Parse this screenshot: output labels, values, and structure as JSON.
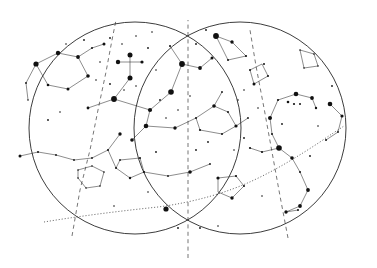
{
  "chart_data": {
    "type": "scatter",
    "xlabel": "",
    "ylabel": "",
    "grid": false,
    "legend": "none",
    "projection": "two overlapping circular horizon discs",
    "cardinals": [
      {
        "label": "SOUTH",
        "x": 188,
        "y": 16
      },
      {
        "label": "W",
        "x": 18,
        "y": 131
      },
      {
        "label": "E",
        "x": 360,
        "y": 131
      }
    ],
    "hour_labels": [
      {
        "label": "4",
        "x": 68,
        "y": 248
      },
      {
        "label": "5",
        "x": 188,
        "y": 256
      },
      {
        "label": "6",
        "x": 288,
        "y": 248
      }
    ],
    "constellations": [
      {
        "name": "VELA",
        "x": 63,
        "y": 71,
        "size": "big"
      },
      {
        "name": "CRUX",
        "x": 140,
        "y": 57,
        "size": "big"
      },
      {
        "name": "CIRCINUS",
        "x": 190,
        "y": 79,
        "size": "big"
      },
      {
        "name": "TRIANG",
        "x": 241,
        "y": 50,
        "size": "small"
      },
      {
        "name": "AUSTR",
        "x": 242,
        "y": 56,
        "size": "small"
      },
      {
        "name": "ARA",
        "x": 249,
        "y": 75,
        "size": "small"
      },
      {
        "name": "TELESCOPIUM",
        "x": 290,
        "y": 62,
        "size": "small"
      },
      {
        "name": "CENTAURUS",
        "x": 135,
        "y": 114,
        "size": "big"
      },
      {
        "name": "LUPUS",
        "x": 222,
        "y": 98,
        "size": "big"
      },
      {
        "name": "SCORPIUS",
        "x": 292,
        "y": 112,
        "size": "big"
      },
      {
        "name": "HYDRA",
        "x": 54,
        "y": 145,
        "size": "small"
      },
      {
        "name": "CRATER",
        "x": 88,
        "y": 180,
        "size": "small"
      },
      {
        "name": "CORVUS",
        "x": 137,
        "y": 175,
        "size": "big"
      },
      {
        "name": "LIBRA",
        "x": 228,
        "y": 172,
        "size": "big"
      },
      {
        "name": "OPHIUCHUS",
        "x": 305,
        "y": 186,
        "size": "small"
      },
      {
        "name": "VIRGO",
        "x": 163,
        "y": 223,
        "size": "small"
      }
    ],
    "named_stars": [
      {
        "name": "Spica",
        "x": 155,
        "y": 206,
        "star_x": 166,
        "star_y": 209,
        "mag_r": 2.6
      },
      {
        "name": "Antares",
        "x": 285,
        "y": 146,
        "star_x": 279,
        "star_y": 148,
        "mag_r": 2.8
      }
    ],
    "ecliptic_labels": [
      {
        "value": "180",
        "x": 64,
        "y": 221
      },
      {
        "value": "190",
        "x": 104,
        "y": 216
      },
      {
        "value": "200",
        "x": 146,
        "y": 212
      },
      {
        "value": "210",
        "x": 183,
        "y": 203
      },
      {
        "value": "220",
        "x": 210,
        "y": 192
      },
      {
        "value": "230",
        "x": 242,
        "y": 188
      },
      {
        "value": "240",
        "x": 265,
        "y": 175
      },
      {
        "value": "250",
        "x": 290,
        "y": 163
      },
      {
        "value": "260",
        "x": 312,
        "y": 146
      },
      {
        "value": "270",
        "x": 333,
        "y": 135
      }
    ],
    "ecliptic_path": "M 44 222 C 80 216 120 211 158 207 C 196 202 228 192 252 181 C 278 169 300 155 320 142 C 330 135 338 130 344 126",
    "boundary_circles": [
      {
        "cx": 135,
        "cy": 128,
        "r": 106
      },
      {
        "cx": 240,
        "cy": 128,
        "r": 106
      }
    ],
    "meridians": [
      {
        "path": "M 72 236 L 80 190 L 90 150 L 98 110 L 106 72 L 112 40 L 116 20"
      },
      {
        "path": "M 188 258 L 188 200 L 188 150 L 188 100 L 188 55 L 188 20"
      },
      {
        "path": "M 288 238 L 280 196 L 272 152 L 264 108 L 256 66 L 250 30"
      }
    ],
    "constellation_lines": [
      "M 36 64 L 58 53 L 78 57 L 88 76 L 68 89 L 48 85 Z",
      "M 78 57 L 92 48 L 104 44",
      "M 36 64 L 26 83 L 28 100",
      "M 130 55 L 130 78",
      "M 118 62 L 142 62",
      "M 114 99 L 130 78",
      "M 114 99 L 88 108",
      "M 114 99 L 150 110",
      "M 150 110 L 171 92",
      "M 150 110 L 146 126",
      "M 146 126 L 175 128",
      "M 146 126 L 132 140",
      "M 171 92 L 182 64",
      "M 182 64 L 170 46",
      "M 182 64 L 200 68",
      "M 200 68 L 212 58",
      "M 175 128 L 196 118",
      "M 196 118 L 214 106",
      "M 214 106 L 228 112",
      "M 228 112 L 236 126",
      "M 236 126 L 222 134",
      "M 222 134 L 200 130",
      "M 200 130 L 196 118",
      "M 214 106 L 222 92",
      "M 236 126 L 248 118",
      "M 216 36 L 232 42",
      "M 232 42 L 246 56",
      "M 246 56 L 228 60",
      "M 228 60 L 216 36",
      "M 250 70 L 262 64",
      "M 262 64 L 268 76",
      "M 268 76 L 254 84",
      "M 254 84 L 250 70",
      "M 300 50 L 314 54",
      "M 314 54 L 318 66",
      "M 318 66 L 304 68",
      "M 304 68 L 300 50",
      "M 270 118 L 278 100",
      "M 278 100 L 296 94",
      "M 296 94 L 312 98",
      "M 312 98 L 316 108",
      "M 270 118 L 272 134",
      "M 272 134 L 279 148",
      "M 279 148 L 292 158",
      "M 292 158 L 300 172",
      "M 300 172 L 308 190",
      "M 308 190 L 300 206",
      "M 300 206 L 286 212",
      "M 279 148 L 262 152",
      "M 262 152 L 250 148",
      "M 330 104 L 342 116",
      "M 342 116 L 338 132",
      "M 338 132 L 326 140",
      "M 20 156 L 38 152 L 56 155 L 74 160 L 92 158 L 108 150 L 120 134",
      "M 108 150 L 116 168",
      "M 116 168 L 130 178",
      "M 130 178 L 144 172",
      "M 144 172 L 140 158",
      "M 140 158 L 120 160",
      "M 120 160 L 116 168",
      "M 78 170 L 92 166 L 104 172 L 100 186 L 86 188 L 78 178 Z",
      "M 144 172 L 168 176 L 190 172 L 210 164",
      "M 218 178 L 236 176 L 244 186 L 232 198 L 218 192 Z",
      "M 286 212 L 298 210"
    ],
    "bright_stars": [
      {
        "x": 36,
        "y": 64,
        "r": 2.6
      },
      {
        "x": 58,
        "y": 53,
        "r": 2.2
      },
      {
        "x": 78,
        "y": 57,
        "r": 1.9
      },
      {
        "x": 88,
        "y": 76,
        "r": 1.8
      },
      {
        "x": 68,
        "y": 89,
        "r": 1.5
      },
      {
        "x": 48,
        "y": 85,
        "r": 1.3
      },
      {
        "x": 130,
        "y": 55,
        "r": 2.5
      },
      {
        "x": 130,
        "y": 78,
        "r": 2.5
      },
      {
        "x": 118,
        "y": 62,
        "r": 2.2
      },
      {
        "x": 142,
        "y": 62,
        "r": 1.6
      },
      {
        "x": 114,
        "y": 99,
        "r": 2.9
      },
      {
        "x": 150,
        "y": 110,
        "r": 2.1
      },
      {
        "x": 171,
        "y": 92,
        "r": 2.8
      },
      {
        "x": 182,
        "y": 64,
        "r": 2.9
      },
      {
        "x": 146,
        "y": 126,
        "r": 2.3
      },
      {
        "x": 175,
        "y": 128,
        "r": 1.7
      },
      {
        "x": 216,
        "y": 36,
        "r": 2.9
      },
      {
        "x": 232,
        "y": 42,
        "r": 1.7
      },
      {
        "x": 200,
        "y": 68,
        "r": 1.9
      },
      {
        "x": 279,
        "y": 148,
        "r": 2.8
      },
      {
        "x": 166,
        "y": 209,
        "r": 2.6
      },
      {
        "x": 296,
        "y": 94,
        "r": 2.3
      },
      {
        "x": 312,
        "y": 98,
        "r": 1.9
      },
      {
        "x": 270,
        "y": 118,
        "r": 2.0
      },
      {
        "x": 292,
        "y": 158,
        "r": 1.8
      },
      {
        "x": 308,
        "y": 190,
        "r": 1.9
      },
      {
        "x": 330,
        "y": 104,
        "r": 2.3
      },
      {
        "x": 342,
        "y": 116,
        "r": 1.6
      },
      {
        "x": 214,
        "y": 106,
        "r": 1.8
      },
      {
        "x": 236,
        "y": 126,
        "r": 1.6
      },
      {
        "x": 132,
        "y": 140,
        "r": 1.8
      },
      {
        "x": 190,
        "y": 172,
        "r": 1.8
      },
      {
        "x": 300,
        "y": 206,
        "r": 1.9
      },
      {
        "x": 286,
        "y": 212,
        "r": 1.7
      },
      {
        "x": 218,
        "y": 178,
        "r": 1.6
      },
      {
        "x": 232,
        "y": 198,
        "r": 1.7
      },
      {
        "x": 120,
        "y": 134,
        "r": 1.7
      },
      {
        "x": 20,
        "y": 156,
        "r": 1.5
      },
      {
        "x": 88,
        "y": 108,
        "r": 1.4
      },
      {
        "x": 212,
        "y": 58,
        "r": 1.5
      },
      {
        "x": 254,
        "y": 84,
        "r": 1.5
      },
      {
        "x": 104,
        "y": 44,
        "r": 1.5
      }
    ],
    "faint_stars": [
      {
        "x": 92,
        "y": 48,
        "r": 1.0
      },
      {
        "x": 110,
        "y": 38,
        "r": 0.9
      },
      {
        "x": 122,
        "y": 44,
        "r": 0.8
      },
      {
        "x": 100,
        "y": 62,
        "r": 0.8
      },
      {
        "x": 96,
        "y": 80,
        "r": 0.8
      },
      {
        "x": 110,
        "y": 84,
        "r": 0.9
      },
      {
        "x": 124,
        "y": 90,
        "r": 0.8
      },
      {
        "x": 136,
        "y": 86,
        "r": 0.8
      },
      {
        "x": 148,
        "y": 48,
        "r": 0.9
      },
      {
        "x": 156,
        "y": 70,
        "r": 0.8
      },
      {
        "x": 160,
        "y": 100,
        "r": 0.9
      },
      {
        "x": 166,
        "y": 118,
        "r": 0.8
      },
      {
        "x": 178,
        "y": 110,
        "r": 0.8
      },
      {
        "x": 190,
        "y": 96,
        "r": 0.8
      },
      {
        "x": 196,
        "y": 118,
        "r": 1.0
      },
      {
        "x": 200,
        "y": 130,
        "r": 1.1
      },
      {
        "x": 208,
        "y": 142,
        "r": 0.9
      },
      {
        "x": 222,
        "y": 134,
        "r": 1.0
      },
      {
        "x": 228,
        "y": 112,
        "r": 1.0
      },
      {
        "x": 222,
        "y": 92,
        "r": 0.9
      },
      {
        "x": 238,
        "y": 100,
        "r": 0.8
      },
      {
        "x": 248,
        "y": 118,
        "r": 0.9
      },
      {
        "x": 244,
        "y": 138,
        "r": 0.9
      },
      {
        "x": 234,
        "y": 150,
        "r": 0.8
      },
      {
        "x": 250,
        "y": 148,
        "r": 1.1
      },
      {
        "x": 262,
        "y": 152,
        "r": 1.1
      },
      {
        "x": 26,
        "y": 83,
        "r": 0.9
      },
      {
        "x": 28,
        "y": 100,
        "r": 0.8
      },
      {
        "x": 48,
        "y": 120,
        "r": 0.9
      },
      {
        "x": 38,
        "y": 152,
        "r": 1.0
      },
      {
        "x": 56,
        "y": 155,
        "r": 0.9
      },
      {
        "x": 74,
        "y": 160,
        "r": 0.9
      },
      {
        "x": 92,
        "y": 158,
        "r": 0.9
      },
      {
        "x": 108,
        "y": 150,
        "r": 1.0
      },
      {
        "x": 116,
        "y": 168,
        "r": 1.0
      },
      {
        "x": 130,
        "y": 178,
        "r": 1.2
      },
      {
        "x": 144,
        "y": 172,
        "r": 1.1
      },
      {
        "x": 140,
        "y": 158,
        "r": 1.0
      },
      {
        "x": 120,
        "y": 160,
        "r": 0.9
      },
      {
        "x": 78,
        "y": 170,
        "r": 0.8
      },
      {
        "x": 92,
        "y": 166,
        "r": 0.8
      },
      {
        "x": 104,
        "y": 172,
        "r": 0.8
      },
      {
        "x": 100,
        "y": 186,
        "r": 0.8
      },
      {
        "x": 86,
        "y": 188,
        "r": 0.8
      },
      {
        "x": 78,
        "y": 178,
        "r": 0.8
      },
      {
        "x": 168,
        "y": 176,
        "r": 0.9
      },
      {
        "x": 210,
        "y": 164,
        "r": 0.9
      },
      {
        "x": 236,
        "y": 176,
        "r": 1.1
      },
      {
        "x": 244,
        "y": 186,
        "r": 1.0
      },
      {
        "x": 178,
        "y": 228,
        "r": 0.9
      },
      {
        "x": 200,
        "y": 228,
        "r": 0.9
      },
      {
        "x": 218,
        "y": 226,
        "r": 0.8
      },
      {
        "x": 264,
        "y": 64,
        "r": 1.0
      },
      {
        "x": 268,
        "y": 76,
        "r": 1.0
      },
      {
        "x": 250,
        "y": 70,
        "r": 1.0
      },
      {
        "x": 246,
        "y": 56,
        "r": 1.1
      },
      {
        "x": 228,
        "y": 60,
        "r": 1.0
      },
      {
        "x": 300,
        "y": 50,
        "r": 0.8
      },
      {
        "x": 314,
        "y": 54,
        "r": 0.8
      },
      {
        "x": 318,
        "y": 66,
        "r": 0.8
      },
      {
        "x": 304,
        "y": 68,
        "r": 0.8
      },
      {
        "x": 278,
        "y": 100,
        "r": 1.1
      },
      {
        "x": 288,
        "y": 102,
        "r": 1.3
      },
      {
        "x": 294,
        "y": 104,
        "r": 1.1
      },
      {
        "x": 300,
        "y": 104,
        "r": 1.0
      },
      {
        "x": 316,
        "y": 108,
        "r": 1.2
      },
      {
        "x": 272,
        "y": 134,
        "r": 1.0
      },
      {
        "x": 300,
        "y": 172,
        "r": 1.0
      },
      {
        "x": 310,
        "y": 156,
        "r": 0.9
      },
      {
        "x": 326,
        "y": 140,
        "r": 1.0
      },
      {
        "x": 338,
        "y": 132,
        "r": 0.9
      },
      {
        "x": 298,
        "y": 210,
        "r": 1.0
      },
      {
        "x": 170,
        "y": 46,
        "r": 1.0
      },
      {
        "x": 196,
        "y": 44,
        "r": 0.9
      },
      {
        "x": 206,
        "y": 30,
        "r": 0.9
      },
      {
        "x": 60,
        "y": 112,
        "r": 0.8
      },
      {
        "x": 156,
        "y": 152,
        "r": 0.9
      },
      {
        "x": 196,
        "y": 150,
        "r": 0.9
      },
      {
        "x": 262,
        "y": 196,
        "r": 0.8
      },
      {
        "x": 282,
        "y": 124,
        "r": 0.9
      },
      {
        "x": 136,
        "y": 36,
        "r": 0.8
      },
      {
        "x": 152,
        "y": 32,
        "r": 0.8
      },
      {
        "x": 84,
        "y": 40,
        "r": 0.9
      },
      {
        "x": 66,
        "y": 44,
        "r": 0.8
      },
      {
        "x": 244,
        "y": 90,
        "r": 0.8
      },
      {
        "x": 258,
        "y": 108,
        "r": 0.8
      },
      {
        "x": 332,
        "y": 86,
        "r": 0.9
      },
      {
        "x": 318,
        "y": 126,
        "r": 0.8
      },
      {
        "x": 148,
        "y": 192,
        "r": 0.8
      },
      {
        "x": 114,
        "y": 206,
        "r": 0.8
      }
    ]
  }
}
